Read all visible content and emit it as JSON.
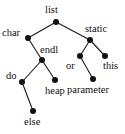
{
  "figure": {
    "name": "binary-tree-diagram",
    "background_color": "#ffffff",
    "node_color": "#111111",
    "edge_color": "#1a1a1a",
    "label_color": "#111111",
    "width": 125,
    "height": 134
  },
  "tree": {
    "root": "list",
    "nodes": [
      {
        "id": "list",
        "label": "list",
        "x": 56,
        "y": 22,
        "label_x": 45,
        "label_y": 5,
        "r": 3.0
      },
      {
        "id": "char",
        "label": "char",
        "x": 28,
        "y": 38,
        "label_x": 2,
        "label_y": 28,
        "r": 3.0
      },
      {
        "id": "static",
        "label": "static",
        "x": 90,
        "y": 40,
        "label_x": 85,
        "label_y": 24,
        "r": 3.0
      },
      {
        "id": "endl",
        "label": "endl",
        "x": 42,
        "y": 60,
        "label_x": 40,
        "label_y": 45,
        "r": 3.0
      },
      {
        "id": "or",
        "label": "or",
        "x": 80,
        "y": 56,
        "label_x": 66,
        "label_y": 61,
        "r": 3.0
      },
      {
        "id": "this",
        "label": "this",
        "x": 105,
        "y": 56,
        "label_x": 103,
        "label_y": 61,
        "r": 3.0
      },
      {
        "id": "do",
        "label": "do",
        "x": 22,
        "y": 82,
        "label_x": 6,
        "label_y": 71,
        "r": 3.0
      },
      {
        "id": "heap",
        "label": "heap",
        "x": 55,
        "y": 80,
        "label_x": 45,
        "label_y": 86,
        "r": 3.0
      },
      {
        "id": "parameter",
        "label": "parameter",
        "x": 93,
        "y": 79,
        "label_x": 67,
        "label_y": 85,
        "r": 3.0
      },
      {
        "id": "else",
        "label": "else",
        "x": 33,
        "y": 111,
        "label_x": 24,
        "label_y": 117,
        "r": 3.0
      }
    ],
    "edges": [
      {
        "from": "list",
        "to": "char",
        "x1": 56,
        "y1": 22,
        "x2": 28,
        "y2": 38
      },
      {
        "from": "list",
        "to": "static",
        "x1": 56,
        "y1": 22,
        "x2": 90,
        "y2": 40
      },
      {
        "from": "char",
        "to": "endl",
        "x1": 28,
        "y1": 38,
        "x2": 42,
        "y2": 60
      },
      {
        "from": "static",
        "to": "or",
        "x1": 90,
        "y1": 40,
        "x2": 80,
        "y2": 56
      },
      {
        "from": "static",
        "to": "this",
        "x1": 90,
        "y1": 40,
        "x2": 105,
        "y2": 56
      },
      {
        "from": "endl",
        "to": "do",
        "x1": 42,
        "y1": 60,
        "x2": 22,
        "y2": 82
      },
      {
        "from": "endl",
        "to": "heap",
        "x1": 42,
        "y1": 60,
        "x2": 55,
        "y2": 80
      },
      {
        "from": "or",
        "to": "parameter",
        "x1": 80,
        "y1": 56,
        "x2": 93,
        "y2": 79
      },
      {
        "from": "do",
        "to": "else",
        "x1": 22,
        "y1": 82,
        "x2": 33,
        "y2": 111
      }
    ]
  }
}
